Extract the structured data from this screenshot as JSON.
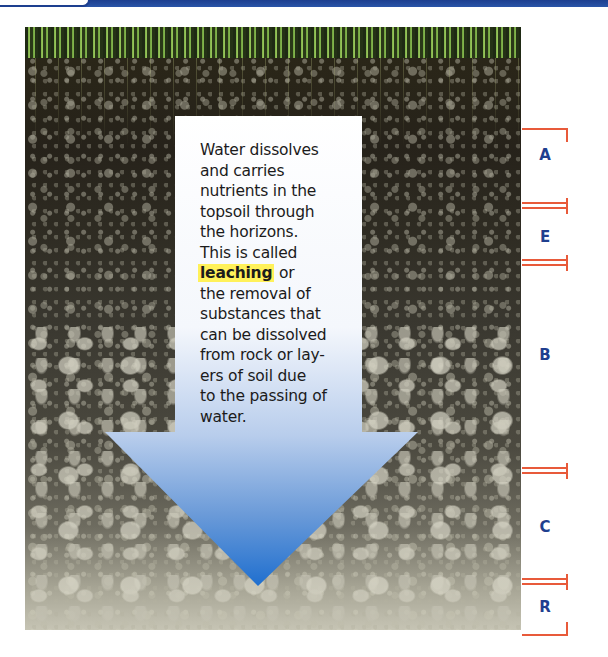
{
  "header": {
    "band_color": "#1d3f8f"
  },
  "diagram": {
    "arrow_text_lines": [
      "Water dissolves",
      "and carries",
      "nutrients in the",
      "topsoil through",
      "the horizons.",
      "This is called"
    ],
    "highlight_term": "leaching",
    "highlight_suffix": " or",
    "arrow_text_lines_after": [
      "the removal of",
      "substances that",
      "can be dissolved",
      "from rock or lay-",
      "ers of soil due",
      "to the passing of",
      "water."
    ],
    "arrow_gradient": [
      "#ffffff",
      "#a9c4ea",
      "#1f6fcf"
    ],
    "highlight_color": "#fff15a",
    "marker_color": "#e85a3a",
    "label_color": "#1f3f8f"
  },
  "horizons": [
    {
      "label": "A"
    },
    {
      "label": "E"
    },
    {
      "label": "B"
    },
    {
      "label": "C"
    },
    {
      "label": "R"
    }
  ]
}
